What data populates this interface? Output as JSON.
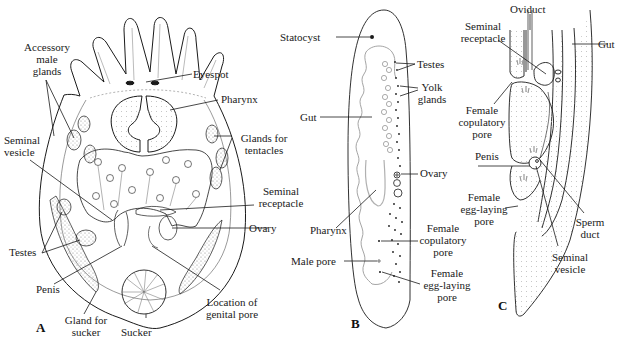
{
  "figure": {
    "panels": [
      {
        "id": "A",
        "letter": "A",
        "labels": {
          "accessory_male_glands": "Accessory\nmale\nglands",
          "eyespot": "Eyespot",
          "pharynx": "Pharynx",
          "seminal_vesicle": "Seminal\nvesicle",
          "glands_for_tentacles": "Glands for\ntentacles",
          "seminal_receptacle": "Seminal\nreceptacle",
          "ovary": "Ovary",
          "testes": "Testes",
          "penis": "Penis",
          "location_of_genital_pore": "Location of\ngenital pore",
          "gland_for_sucker": "Gland for\nsucker",
          "sucker": "Sucker"
        }
      },
      {
        "id": "B",
        "letter": "B",
        "labels": {
          "statocyst": "Statocyst",
          "testes": "Testes",
          "yolk_glands": "Yolk\nglands",
          "gut": "Gut",
          "ovary": "Ovary",
          "pharynx": "Pharynx",
          "female_copulatory_pore": "Female\ncopulatory\npore",
          "male_pore": "Male pore",
          "female_egg_laying_pore": "Female\negg-laying\npore"
        }
      },
      {
        "id": "C",
        "letter": "C",
        "labels": {
          "oviduct": "Oviduct",
          "seminal_receptacle": "Seminal\nreceptacle",
          "gut": "Gut",
          "female_copulatory_pore": "Female\ncopulatory\npore",
          "penis": "Penis",
          "female_egg_laying_pore": "Female\negg-laying\npore",
          "sperm_duct": "Sperm\nduct",
          "seminal_vesicle": "Seminal\nvesicle"
        }
      }
    ],
    "colors": {
      "ink": "#1a1a1a",
      "stipple": "#9a9a9a",
      "background": "#ffffff"
    }
  }
}
